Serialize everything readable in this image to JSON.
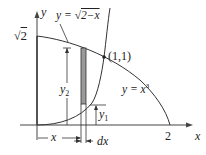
{
  "diagram": {
    "type": "area-between-curves",
    "labels": {
      "y_axis": "y",
      "x_axis": "x",
      "sqrt2": "√2",
      "two": "2",
      "curve_top": "y = √2−x",
      "curve_top_prefix": "y = ",
      "curve_top_radicand": "2−x",
      "curve_bottom": "y = x³",
      "curve_bottom_prefix": "y = x",
      "curve_bottom_exp": "3",
      "intersection": "(1,1)",
      "y1": "y",
      "y1_sub": "1",
      "y2": "y",
      "y2_sub": "2",
      "x_dim": "x",
      "dx": "dx"
    },
    "curves": [
      {
        "name": "upper",
        "equation": "x = 2 - y^2 (y = sqrt(2 - x))",
        "from": [
          0,
          1.414
        ],
        "to": [
          2,
          0
        ]
      },
      {
        "name": "lower",
        "equation": "y = x^3",
        "from": [
          0,
          0
        ],
        "to": [
          1,
          1
        ]
      }
    ],
    "intersection_point": [
      1,
      1
    ],
    "strip": {
      "x": 0.68,
      "width": "dx",
      "fill": "#9a9a9a"
    },
    "colors": {
      "stroke": "#333333",
      "strip": "#9a9a9a"
    }
  }
}
